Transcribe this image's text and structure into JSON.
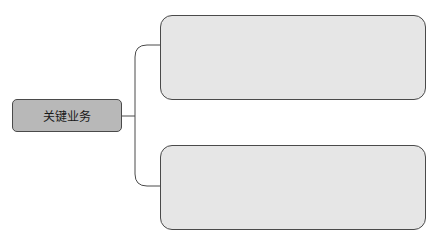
{
  "diagram": {
    "root": {
      "label": "关键业务"
    },
    "children": [
      {
        "label": ""
      },
      {
        "label": ""
      }
    ],
    "colors": {
      "root_fill": "#b8b8b8",
      "child_fill": "#e6e6e6",
      "stroke": "#4a4a4a"
    }
  }
}
